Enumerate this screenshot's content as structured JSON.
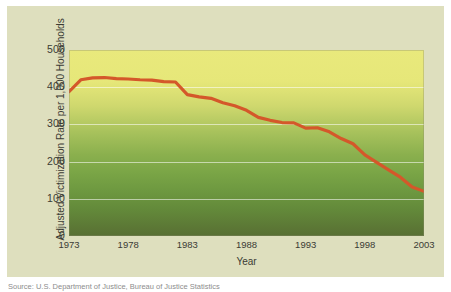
{
  "figure": {
    "caption": "Source: U.S. Department of Justice, Bureau of Justice Statistics",
    "panel_color": "#dedfbe",
    "line_color": "#d4582a"
  },
  "chart_data": {
    "type": "line",
    "title": "",
    "xlabel": "Year",
    "ylabel": "Adjusted Victimization Rate per 1,000 Households",
    "xlim": [
      1973,
      2003
    ],
    "ylim": [
      0,
      500
    ],
    "grid": true,
    "legend": "none",
    "ytick_labels": [
      "0",
      "100",
      "200",
      "300",
      "400",
      "500"
    ],
    "ytick_values": [
      0,
      100,
      200,
      300,
      400,
      500
    ],
    "xtick_labels": [
      "1973",
      "1978",
      "1983",
      "1988",
      "1993",
      "1998",
      "2003"
    ],
    "xtick_values": [
      1973,
      1978,
      1983,
      1988,
      1993,
      1998,
      2003
    ],
    "x": [
      1973,
      1974,
      1975,
      1976,
      1977,
      1978,
      1979,
      1980,
      1981,
      1982,
      1983,
      1984,
      1985,
      1986,
      1987,
      1988,
      1989,
      1990,
      1991,
      1992,
      1993,
      1994,
      1995,
      1996,
      1997,
      1998,
      1999,
      2000,
      2001,
      2002,
      2003
    ],
    "values": [
      388,
      420,
      425,
      426,
      423,
      422,
      420,
      419,
      415,
      414,
      380,
      374,
      370,
      358,
      350,
      338,
      319,
      311,
      305,
      304,
      290,
      291,
      280,
      262,
      248,
      218,
      198,
      178,
      158,
      132,
      120
    ],
    "series": [
      {
        "name": "Adjusted household victimization rate",
        "values": [
          388,
          420,
          425,
          426,
          423,
          422,
          420,
          419,
          415,
          414,
          380,
          374,
          370,
          358,
          350,
          338,
          319,
          311,
          305,
          304,
          290,
          291,
          280,
          262,
          248,
          218,
          198,
          178,
          158,
          132,
          120
        ]
      }
    ]
  }
}
